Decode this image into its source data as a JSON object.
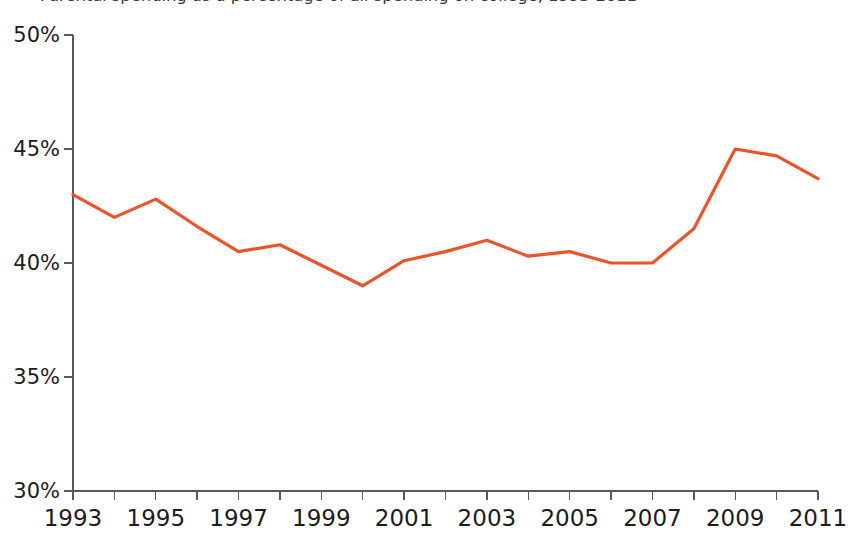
{
  "chart_data": {
    "type": "line",
    "title": "Parental spending as a percentage of all spending on college, 1993-2011",
    "subtitle": "",
    "xlabel": "",
    "ylabel": "",
    "xlim": [
      1993,
      2011
    ],
    "ylim": [
      30,
      50
    ],
    "grid": false,
    "legend": false,
    "legend_position": "none",
    "line_color": "#e9552b",
    "axis_color": "#58585a",
    "background_color": "#ffffff",
    "y_tick_values": [
      50,
      45,
      40,
      35,
      30
    ],
    "y_tick_labels": [
      "50%",
      "45%",
      "40%",
      "35%",
      "30%"
    ],
    "x_tick_values": [
      1993,
      1994,
      1995,
      1996,
      1997,
      1998,
      1999,
      2000,
      2001,
      2002,
      2003,
      2004,
      2005,
      2006,
      2007,
      2008,
      2009,
      2010,
      2011
    ],
    "x_tick_labels_shown": [
      "1993",
      "1995",
      "1997",
      "1999",
      "2001",
      "2003",
      "2005",
      "2007",
      "2009",
      "2011"
    ],
    "x": [
      1993,
      1994,
      1995,
      1996,
      1997,
      1998,
      1999,
      2000,
      2001,
      2002,
      2003,
      2004,
      2005,
      2006,
      2007,
      2008,
      2009,
      2010,
      2011
    ],
    "values": [
      43.0,
      42.0,
      42.8,
      41.6,
      40.5,
      40.8,
      39.9,
      39.0,
      40.1,
      40.5,
      41.0,
      40.3,
      40.5,
      40.0,
      40.0,
      41.5,
      45.0,
      44.7,
      43.7
    ],
    "series": [
      {
        "name": "Parental spending share",
        "color": "#e9552b",
        "values": [
          43.0,
          42.0,
          42.8,
          41.6,
          40.5,
          40.8,
          39.9,
          39.0,
          40.1,
          40.5,
          41.0,
          40.3,
          40.5,
          40.0,
          40.0,
          41.5,
          45.0,
          44.7,
          43.7
        ]
      }
    ]
  },
  "axes": {
    "y_axis_name": "percentage-axis",
    "x_axis_name": "year-axis"
  }
}
